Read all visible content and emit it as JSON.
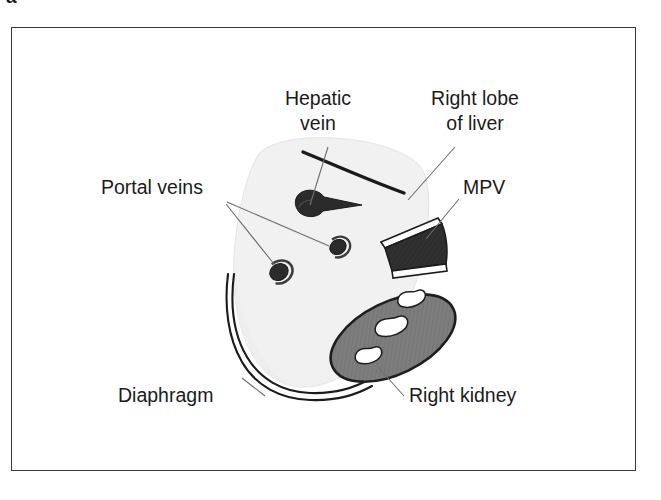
{
  "figure": {
    "label_fragment": "a",
    "frame_color": "#3a3a3a",
    "background_color": "#ffffff"
  },
  "palette": {
    "liver_fill": "#f1f1f1",
    "liver_edge": "#dcdcdc",
    "vessel_dark": "#2b2b2b",
    "kidney_fill": "#787878",
    "kidney_outline": "#1e1e1e",
    "kidney_sinus": "#ffffff",
    "mpv_fill": "#2d2d2d",
    "outline": "#1b1b1b",
    "leader_line": "#6e6e6e",
    "text": "#1b1b1b"
  },
  "labels": [
    {
      "id": "hepatic-vein",
      "line1": "Hepatic",
      "line2": "vein",
      "x": 318,
      "y": 105,
      "anchor": "middle"
    },
    {
      "id": "right-lobe-of-liver",
      "line1": "Right lobe",
      "line2": "of liver",
      "x": 475,
      "y": 105,
      "anchor": "middle"
    },
    {
      "id": "portal-veins",
      "line1": "Portal veins",
      "line2": "",
      "x": 101,
      "y": 194,
      "anchor": "start"
    },
    {
      "id": "mpv",
      "line1": "MPV",
      "line2": "",
      "x": 463,
      "y": 194,
      "anchor": "start"
    },
    {
      "id": "diaphragm",
      "line1": "Diaphragm",
      "line2": "",
      "x": 118,
      "y": 402,
      "anchor": "start"
    },
    {
      "id": "right-kidney",
      "line1": "Right kidney",
      "line2": "",
      "x": 409,
      "y": 402,
      "anchor": "start"
    }
  ],
  "structures": {
    "liver": {
      "name": "Right lobe of liver",
      "fill": "#f1f1f1"
    },
    "hepatic_vein": {
      "name": "Hepatic vein",
      "fill": "#2b2b2b"
    },
    "portal_veins": {
      "name": "Portal veins",
      "count": 2,
      "fill": "#2b2b2b"
    },
    "mpv": {
      "name": "MPV",
      "full_name": "Main portal vein",
      "fill": "#2d2d2d"
    },
    "right_kidney": {
      "name": "Right kidney",
      "fill": "#787878",
      "sinus_count": 3
    },
    "diaphragm": {
      "name": "Diaphragm",
      "stroke": "#1b1b1b",
      "line_count": 2
    }
  }
}
